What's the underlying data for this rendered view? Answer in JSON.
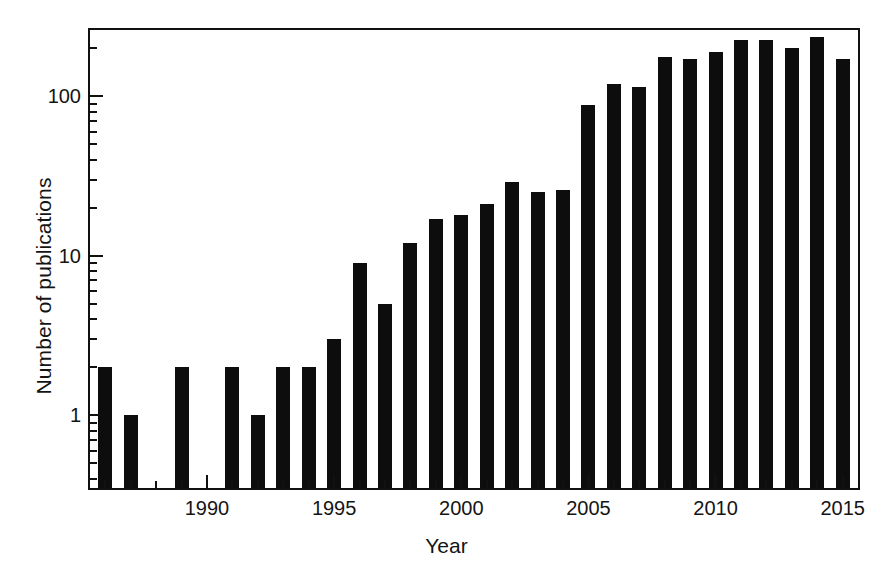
{
  "chart_data": {
    "type": "bar",
    "title": "",
    "subtitle": "",
    "xlabel": "Year",
    "ylabel": "Number of publications",
    "yscale": "log",
    "ylim": [
      0.35,
      260
    ],
    "xlim": [
      1985.4,
      2015.6
    ],
    "grid": false,
    "legend": null,
    "annotations": [],
    "bar_color": "#0d0d0d",
    "axis_color": "#111111",
    "y_major_ticks": [
      1,
      10,
      100
    ],
    "y_major_tick_labels": [
      "1",
      "10",
      "100"
    ],
    "y_minor_ticks": [
      0.4,
      0.5,
      0.6,
      0.7,
      0.8,
      0.9,
      2,
      3,
      4,
      5,
      6,
      7,
      8,
      9,
      20,
      30,
      40,
      50,
      60,
      70,
      80,
      90,
      200
    ],
    "x_major_ticks": [
      1990,
      1995,
      2000,
      2005,
      2010,
      2015
    ],
    "x_major_tick_labels": [
      "1990",
      "1995",
      "2000",
      "2005",
      "2010",
      "2015"
    ],
    "x_minor_ticks": [
      1986,
      1987,
      1988,
      1989,
      1991,
      1992,
      1993,
      1994,
      1996,
      1997,
      1998,
      1999,
      2001,
      2002,
      2003,
      2004,
      2006,
      2007,
      2008,
      2009,
      2011,
      2012,
      2013,
      2014
    ],
    "categories": [
      1986,
      1987,
      1988,
      1989,
      1990,
      1991,
      1992,
      1993,
      1994,
      1995,
      1996,
      1997,
      1998,
      1999,
      2000,
      2001,
      2002,
      2003,
      2004,
      2005,
      2006,
      2007,
      2008,
      2009,
      2010,
      2011,
      2012,
      2013,
      2014,
      2015
    ],
    "values": [
      2,
      1,
      0,
      2,
      0,
      2,
      1,
      2,
      2,
      3,
      9,
      5,
      12,
      17,
      18,
      21,
      29,
      25,
      26,
      88,
      120,
      115,
      175,
      172,
      190,
      225,
      224,
      200,
      235,
      170
    ]
  }
}
